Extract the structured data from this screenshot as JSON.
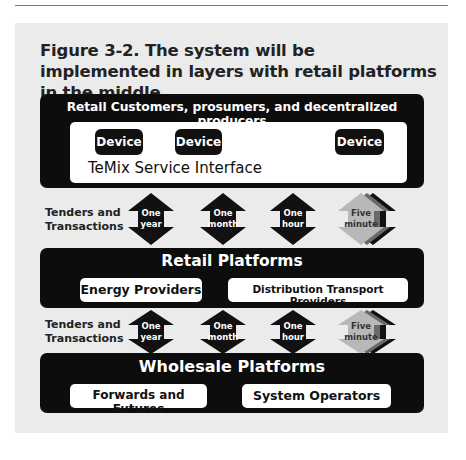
{
  "figure": {
    "title": "Figure 3-2. The system will be implemented in layers with retail platforms in the middle.",
    "colors": {
      "panel": "#ebebeb",
      "layer": "#0d0d0d",
      "inner_box": "#ffffff",
      "five_minute_arrow": "#b5b5b5"
    }
  },
  "customers_layer": {
    "header": "Retail Customers, prosumers, and decentralized producers",
    "devices": [
      "Device",
      "Device",
      "Device"
    ],
    "interface_label": "TeMix Service Interface"
  },
  "transactions_rows": [
    {
      "label_line1": "Tenders and",
      "label_line2": "Transactions",
      "arrows": [
        {
          "line1": "One",
          "line2": "year",
          "icon": "double-arrow-icon"
        },
        {
          "line1": "One",
          "line2": "month",
          "icon": "double-arrow-icon"
        },
        {
          "line1": "One",
          "line2": "hour",
          "icon": "double-arrow-icon"
        },
        {
          "line1": "Five",
          "line2": "minute",
          "icon": "stacked-double-arrow-icon"
        }
      ]
    },
    {
      "label_line1": "Tenders and",
      "label_line2": "Transactions",
      "arrows": [
        {
          "line1": "One",
          "line2": "year",
          "icon": "double-arrow-icon"
        },
        {
          "line1": "One",
          "line2": "month",
          "icon": "double-arrow-icon"
        },
        {
          "line1": "One",
          "line2": "hour",
          "icon": "double-arrow-icon"
        },
        {
          "line1": "Five",
          "line2": "minute",
          "icon": "stacked-double-arrow-icon"
        }
      ]
    }
  ],
  "retail_layer": {
    "header": "Retail Platforms",
    "boxes": [
      "Energy Providers",
      "Distribution Transport Providers"
    ]
  },
  "wholesale_layer": {
    "header": "Wholesale Platforms",
    "boxes": [
      "Forwards and Futures",
      "System Operators"
    ]
  }
}
